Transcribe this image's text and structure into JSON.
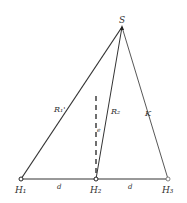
{
  "diagram": {
    "points": {
      "S": {
        "label": "S",
        "x": 122,
        "y": 27
      },
      "H1": {
        "label": "H₁",
        "x": 21,
        "y": 179
      },
      "H2": {
        "label": "H₂",
        "x": 96,
        "y": 179
      },
      "H3": {
        "label": "H₃",
        "x": 168,
        "y": 179
      }
    },
    "edges": [
      {
        "from": "S",
        "to": "H1",
        "label": "R₁'"
      },
      {
        "from": "S",
        "to": "H2",
        "label": "R₂"
      },
      {
        "from": "S",
        "to": "H3",
        "label": "K"
      },
      {
        "from": "H1",
        "to": "H2",
        "label": "d"
      },
      {
        "from": "H2",
        "to": "H3",
        "label": "d"
      }
    ],
    "dashed_line": {
      "label": "e"
    },
    "labels": {
      "S": "S",
      "R1": "R₁'",
      "R2": "R₂",
      "K": "K",
      "e": "e",
      "d1": "d",
      "d2": "d",
      "H1": "H₁",
      "H2": "H₂",
      "H3": "H₃"
    }
  }
}
